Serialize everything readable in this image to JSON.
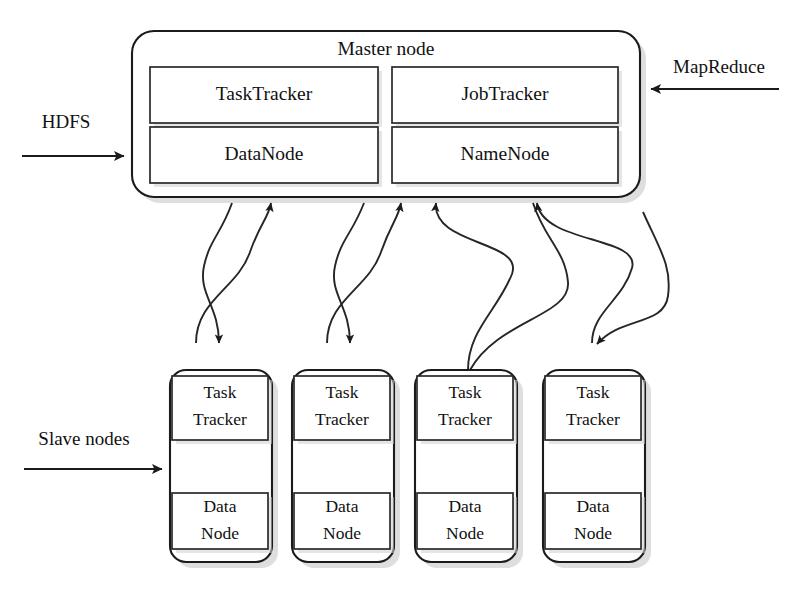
{
  "diagram": {
    "master": {
      "label": "Master node",
      "components": [
        {
          "name": "TaskTracker",
          "label": "TaskTracker"
        },
        {
          "name": "JobTracker",
          "label": "JobTracker"
        },
        {
          "name": "DataNode",
          "label": "DataNode"
        },
        {
          "name": "NameNode",
          "label": "NameNode"
        }
      ]
    },
    "slaves": {
      "group_label": "Slave nodes",
      "nodes": [
        {
          "tracker_line1": "Task",
          "tracker_line2": "Tracker",
          "data_line1": "Data",
          "data_line2": "Node"
        },
        {
          "tracker_line1": "Task",
          "tracker_line2": "Tracker",
          "data_line1": "Data",
          "data_line2": "Node"
        },
        {
          "tracker_line1": "Task",
          "tracker_line2": "Tracker",
          "data_line1": "Data",
          "data_line2": "Node"
        },
        {
          "tracker_line1": "Task",
          "tracker_line2": "Tracker",
          "data_line1": "Data",
          "data_line2": "Node"
        }
      ]
    },
    "external_labels": {
      "hdfs": "HDFS",
      "mapreduce": "MapReduce",
      "slave_nodes": "Slave nodes"
    },
    "colors": {
      "stroke": "#1b1b1b",
      "fill": "#ffffff",
      "shadow": "#c9c9c9",
      "background": "#ffffff"
    }
  }
}
